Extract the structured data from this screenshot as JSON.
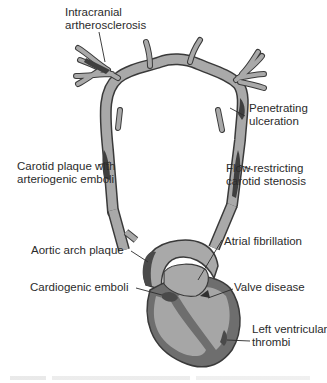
{
  "diagram": {
    "colors": {
      "vessel_fill": "#a9a9a9",
      "vessel_outline": "#3a3a3a",
      "plaque": "#4a4a4a",
      "heart_wall": "#6e6e6e",
      "heart_chamber": "#a6a6a6",
      "leader_line": "#2b2b2b",
      "text": "#2b2b2b"
    },
    "labels": {
      "intracranial": [
        "Intracranial",
        "artherosclerosis"
      ],
      "penetrating": [
        "Penetrating",
        "ulceration"
      ],
      "carotid_plaque": [
        "Carotid plaque with",
        "arteriogenic emboli"
      ],
      "flow_restricting": [
        "Flow restricting",
        "carotid stenosis"
      ],
      "aortic_arch": [
        "Aortic arch plaque"
      ],
      "atrial_fib": [
        "Atrial fibrillation"
      ],
      "cardiogenic": [
        "Cardiogenic emboli"
      ],
      "valve": [
        "Valve disease"
      ],
      "left_ventricular": [
        "Left ventricular",
        "thrombi"
      ]
    }
  }
}
